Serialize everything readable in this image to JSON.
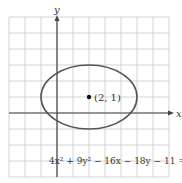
{
  "diagram": {
    "axis_labels": {
      "x": "x",
      "y": "y"
    },
    "center_label": "(2, 1)",
    "equation": "4x² + 9y² − 16x − 18y − 11 = 0",
    "grid": {
      "x_min": -3,
      "x_max": 7,
      "y_min": -4,
      "y_max": 6
    },
    "ellipse": {
      "center": [
        2,
        1
      ],
      "a": 3,
      "b": 2
    },
    "colors": {
      "grid": "#c8c8c8",
      "axis": "#444444",
      "ellipse": "#555555"
    }
  }
}
